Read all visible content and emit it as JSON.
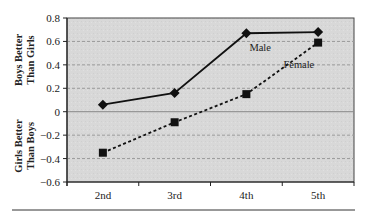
{
  "chart_data": {
    "type": "line",
    "title": "",
    "xlabel": "",
    "ylabel": "",
    "categories": [
      "2nd",
      "3rd",
      "4th",
      "5th"
    ],
    "series": [
      {
        "name": "Male",
        "marker": "diamond",
        "line_style": "solid",
        "values": [
          0.06,
          0.16,
          0.67,
          0.68
        ]
      },
      {
        "name": "Female",
        "marker": "square",
        "line_style": "dashed",
        "values": [
          -0.35,
          -0.09,
          0.15,
          0.59
        ]
      }
    ],
    "ylim": [
      -0.6,
      0.8
    ],
    "yticks": [
      0.8,
      0.6,
      0.4,
      0.2,
      0,
      -0.2,
      -0.4,
      -0.6
    ],
    "ytick_labels": [
      "0.8",
      "0.6",
      "0.4",
      "0.2",
      "0",
      "−0.2",
      "−0.4",
      "−0.6"
    ],
    "grid": true,
    "legend_position": "inline labels near lines",
    "annotations": [
      {
        "text": "Male",
        "near": "4th male point"
      },
      {
        "text": "Female",
        "near": "between 4th and 5th female points"
      }
    ],
    "side_labels": {
      "upper": [
        "Boys Better",
        "Than Girls"
      ],
      "lower": [
        "Girls Better",
        "Than Boys"
      ]
    }
  },
  "colors": {
    "plot_background": "#d9d9d9",
    "line": "#111111",
    "grid": "#9a9a9a",
    "axis": "#222222"
  }
}
